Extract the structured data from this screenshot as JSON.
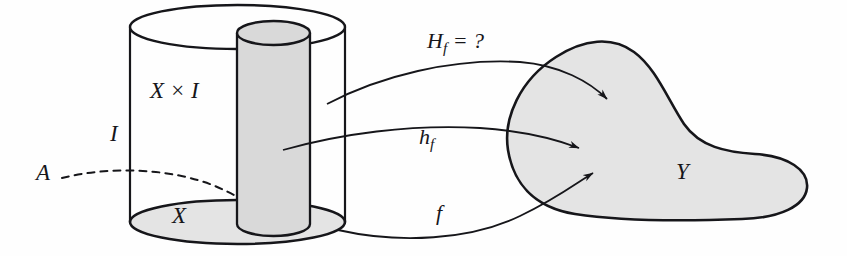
{
  "figure": {
    "kind": "homotopy-extension-diagram",
    "width": 847,
    "height": 256,
    "background_color": "#fefefe",
    "ink_color": "#16161a",
    "shade_color": "#e0e0e0",
    "labels": {
      "cylinder_body": "X × I",
      "interval": "I",
      "base_space": "X",
      "subspace": "A",
      "extension_map": "H",
      "extension_map_sub": "f",
      "extension_map_tail": " = ?",
      "homotopy_map": "h",
      "homotopy_map_sub": "f",
      "base_map": "f",
      "target_space": "Y"
    },
    "shapes": {
      "outer_cylinder": {
        "name": "X × I",
        "left": 130,
        "right": 345,
        "top_center_y": 27,
        "bottom_center_y": 222,
        "ellipse_ry": 22,
        "filled": false
      },
      "inner_cylinder": {
        "name": "A × I",
        "left": 237,
        "right": 310,
        "top_center_y": 33,
        "bottom_center_y": 224,
        "ellipse_ry": 12,
        "filled": true
      },
      "target_blob": {
        "name": "Y",
        "left": 505,
        "right": 807,
        "top": 40,
        "bottom": 220,
        "filled": true
      },
      "dashed_subspace_curve": {
        "name": "A",
        "from_x": 62,
        "from_y": 178,
        "to_x": 281,
        "to_y": 226
      }
    },
    "arrows": [
      {
        "name": "H_f",
        "label": "H_f = ?",
        "tip_x": 614,
        "tip_y": 103
      },
      {
        "name": "h_f",
        "label": "h_f",
        "tip_x": 586,
        "tip_y": 150
      },
      {
        "name": "f",
        "label": "f",
        "tip_x": 600,
        "tip_y": 171
      }
    ]
  }
}
